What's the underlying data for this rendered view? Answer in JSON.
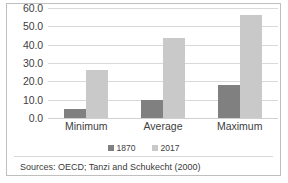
{
  "chart_data": {
    "type": "bar",
    "title": "",
    "xlabel": "",
    "ylabel": "",
    "categories": [
      "Minimum",
      "Average",
      "Maximum"
    ],
    "series": [
      {
        "name": "1870",
        "color": "#808080",
        "values": [
          5.0,
          10.0,
          18.0
        ]
      },
      {
        "name": "2017",
        "color": "#c9c9c9",
        "values": [
          26.0,
          43.5,
          56.0
        ]
      }
    ],
    "ylim": [
      0,
      60
    ],
    "yticks": [
      0.0,
      10.0,
      20.0,
      30.0,
      40.0,
      50.0,
      60.0
    ],
    "ytick_labels": [
      "0.0",
      "10.0",
      "20.0",
      "30.0",
      "40.0",
      "50.0",
      "60.0"
    ],
    "grid": true,
    "legend_position": "bottom"
  },
  "footnote": {
    "source": "Sources: OECD; Tanzi and Schukecht (2000)"
  },
  "colors": {
    "series_1870": "#808080",
    "series_2017": "#c9c9c9",
    "gridline": "#d9d9d9",
    "frame": "#bfbfbf",
    "text": "#404040"
  }
}
